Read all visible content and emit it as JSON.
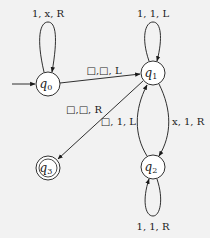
{
  "diagram": {
    "type": "turing-machine-state-diagram",
    "background": "#f2f2f2",
    "stroke_color": "#1a1a1a",
    "states": [
      {
        "id": "q0",
        "name": "q",
        "subscript": "0",
        "start": true,
        "accept": false
      },
      {
        "id": "q1",
        "name": "q",
        "subscript": "1",
        "start": false,
        "accept": false
      },
      {
        "id": "q2",
        "name": "q",
        "subscript": "2",
        "start": false,
        "accept": false
      },
      {
        "id": "q3",
        "name": "q",
        "subscript": "3",
        "start": false,
        "accept": true
      }
    ],
    "transitions": [
      {
        "from": "q0",
        "to": "q0",
        "read": "1",
        "write": "x",
        "move": "R",
        "label": "1, x, R"
      },
      {
        "from": "q0",
        "to": "q1",
        "read": "□",
        "write": "□",
        "move": "L",
        "label": "□,□, L"
      },
      {
        "from": "q1",
        "to": "q1",
        "read": "1",
        "write": "1",
        "move": "L",
        "label": "1, 1, L"
      },
      {
        "from": "q1",
        "to": "q3",
        "read": "□",
        "write": "□",
        "move": "R",
        "label": "□,□, R"
      },
      {
        "from": "q1",
        "to": "q2",
        "read": "x",
        "write": "1",
        "move": "R",
        "label": "x, 1, R"
      },
      {
        "from": "q2",
        "to": "q1",
        "read": "□",
        "write": "1",
        "move": "L",
        "label": "□, 1, L"
      },
      {
        "from": "q2",
        "to": "q2",
        "read": "1",
        "write": "1",
        "move": "R",
        "label": "1, 1, R"
      }
    ]
  }
}
